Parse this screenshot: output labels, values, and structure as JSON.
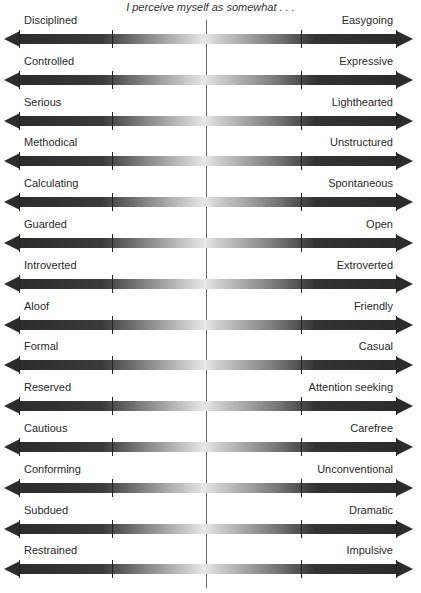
{
  "title": "I perceive myself as somewhat . . .",
  "scales": [
    {
      "left": "Disciplined",
      "right": "Easygoing"
    },
    {
      "left": "Controlled",
      "right": "Expressive"
    },
    {
      "left": "Serious",
      "right": "Lighthearted"
    },
    {
      "left": "Methodical",
      "right": "Unstructured"
    },
    {
      "left": "Calculating",
      "right": "Spontaneous"
    },
    {
      "left": "Guarded",
      "right": "Open"
    },
    {
      "left": "Introverted",
      "right": "Extroverted"
    },
    {
      "left": "Aloof",
      "right": "Friendly"
    },
    {
      "left": "Formal",
      "right": "Casual"
    },
    {
      "left": "Reserved",
      "right": "Attention seeking"
    },
    {
      "left": "Cautious",
      "right": "Carefree"
    },
    {
      "left": "Conforming",
      "right": "Unconventional"
    },
    {
      "left": "Subdued",
      "right": "Dramatic"
    },
    {
      "left": "Restrained",
      "right": "Impulsive"
    }
  ]
}
